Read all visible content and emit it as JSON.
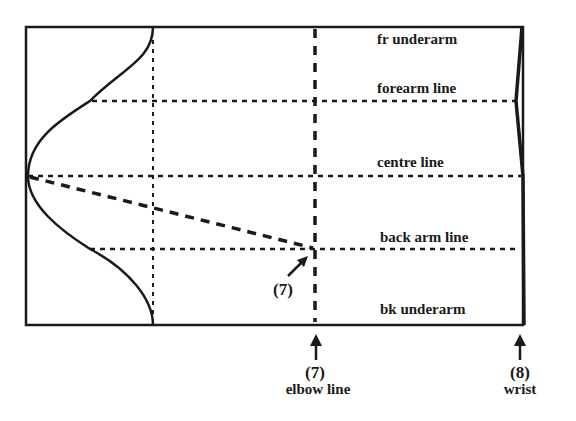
{
  "diagram": {
    "type": "sleeve pattern draft",
    "line_labels": {
      "fr_underarm": "fr underarm",
      "forearm_line": "forearm line",
      "centre_line": "centre line",
      "back_arm_line": "back arm line",
      "bk_underarm": "bk underarm"
    },
    "markers": {
      "elbow_point_number": "(7)",
      "elbow_number": "(7)",
      "elbow_label": "elbow line",
      "wrist_number": "(8)",
      "wrist_label": "wrist"
    },
    "colors": {
      "ink": "#1a1a1a",
      "background": "#ffffff"
    }
  }
}
